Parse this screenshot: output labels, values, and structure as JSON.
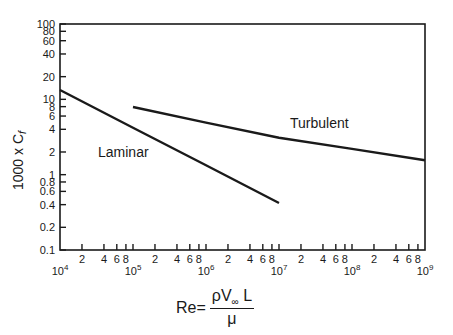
{
  "chart_data": {
    "type": "line",
    "title": "",
    "xlabel": "Re = ρV∞L / μ",
    "ylabel": "1000 × Cf",
    "xscale": "log",
    "yscale": "log",
    "xlim": [
      10000,
      1000000000
    ],
    "ylim": [
      0.1,
      100
    ],
    "grid": false,
    "legend": "inline labels",
    "x_major_ticks": [
      "10^4",
      "10^5",
      "10^6",
      "10^7",
      "10^8",
      "10^9"
    ],
    "x_minor_tick_labels": [
      "2",
      "4",
      "6",
      "8"
    ],
    "y_tick_labels": [
      "0.1",
      "0.2",
      "0.4",
      "0.6",
      "0.8",
      "1",
      "2",
      "4",
      "6",
      "8",
      "10",
      "20",
      "40",
      "60",
      "80",
      "100"
    ],
    "series": [
      {
        "name": "Laminar",
        "x": [
          10000,
          100000,
          1000000,
          10000000
        ],
        "y": [
          13.3,
          4.2,
          1.33,
          0.42
        ]
      },
      {
        "name": "Turbulent",
        "x": [
          100000,
          1000000,
          10000000,
          100000000,
          1000000000
        ],
        "y": [
          7.9,
          4.9,
          3.1,
          2.2,
          1.55
        ]
      }
    ]
  },
  "labels": {
    "ylabel": "1000 x C",
    "ylabel_sub": "f",
    "laminar": "Laminar",
    "turbulent": "Turbulent",
    "xlabel_prefix": "Re=",
    "xlabel_num_rho": "ρV",
    "xlabel_num_sub": "∞",
    "xlabel_num_L": " L",
    "xlabel_den": "μ"
  },
  "x_major_labels": [
    {
      "base": "10",
      "exp": "4"
    },
    {
      "base": "10",
      "exp": "5"
    },
    {
      "base": "10",
      "exp": "6"
    },
    {
      "base": "10",
      "exp": "7"
    },
    {
      "base": "10",
      "exp": "8"
    },
    {
      "base": "10",
      "exp": "9"
    }
  ]
}
